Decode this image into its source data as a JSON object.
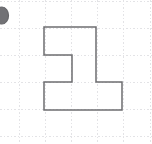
{
  "figure": {
    "canvas": {
      "width": 152,
      "height": 144
    },
    "background_color": "#ffffff"
  },
  "grid": {
    "line_color": "#e3e3e6",
    "dash_pattern": "1.6,1.9",
    "cell_width": 26.2,
    "cell_height": 26.9,
    "vertical_lines_x": [
      19,
      45.2,
      71.4,
      97.6,
      123.8,
      150
    ],
    "horizontal_lines_y": [
      1.8,
      28.7,
      55.6,
      82.5,
      109.4,
      136.3
    ],
    "visible": true
  },
  "shape": {
    "name": "stepped-polygon",
    "stroke_color": "#6d6d70",
    "stroke_width": 1.5,
    "fill": "none",
    "vertices": [
      [
        44,
        27
      ],
      [
        96,
        27
      ],
      [
        96,
        82
      ],
      [
        122,
        82
      ],
      [
        122,
        110
      ],
      [
        44,
        110
      ],
      [
        44,
        82
      ],
      [
        72,
        82
      ],
      [
        72,
        55
      ],
      [
        44,
        55
      ]
    ],
    "path": "M44,27 L96,27 L96,82 L122,82 L122,110 L44,110 L44,82 L72,82 L72,55 L44,55 Z",
    "vertex_count": 10,
    "unit_area_squares": 8
  },
  "marker": {
    "name": "label-bullet",
    "description": "Dark circular label marker clipped by the left edge",
    "center_x": 2,
    "center_y": 15.5,
    "radius_x": 6.5,
    "radius_y": 8.5,
    "fill_color": "#3d3d42",
    "stroke_color": "#2b2b30",
    "opacity": 0.72
  }
}
